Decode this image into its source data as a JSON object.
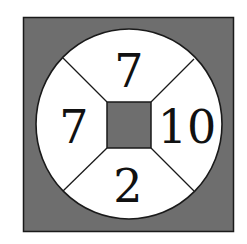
{
  "puzzle": {
    "type": "number-wheel",
    "colors": {
      "background": "#ffffff",
      "outer_square_fill": "#6e6e6e",
      "circle_fill": "#ffffff",
      "center_square_fill": "#6e6e6e",
      "stroke": "#1a1a1a",
      "text": "#111111"
    },
    "segments": {
      "top": "7",
      "left": "7",
      "right": "10",
      "bottom": "2"
    },
    "center": ""
  }
}
